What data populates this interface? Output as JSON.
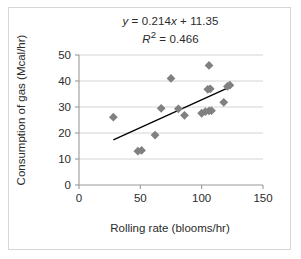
{
  "chart_data": {
    "type": "scatter",
    "title": "",
    "xlabel": "Rolling rate (blooms/hr)",
    "ylabel": "Consumption of gas (Mcal/hr)",
    "xlim": [
      0,
      150
    ],
    "ylim": [
      0,
      50
    ],
    "xticks": [
      "0",
      "50",
      "100",
      "150"
    ],
    "yticks": [
      "0",
      "10",
      "20",
      "30",
      "40",
      "50"
    ],
    "xtick_values": [
      0,
      50,
      100,
      150
    ],
    "ytick_values": [
      0,
      10,
      20,
      30,
      40,
      50
    ],
    "grid": "horizontal",
    "legend": "none",
    "marker": "diamond",
    "marker_color": "#808080",
    "trendline_color": "#000000",
    "annotations": {
      "equation": "y = 0.214x + 11.35",
      "r_squared": "R² = 0.466"
    },
    "fit": {
      "slope": 0.214,
      "intercept": 11.35,
      "r2": 0.466,
      "x_start": 28,
      "x_end": 125
    },
    "points": [
      {
        "x": 28,
        "y": 26.1
      },
      {
        "x": 48,
        "y": 13.0
      },
      {
        "x": 51,
        "y": 13.3
      },
      {
        "x": 62,
        "y": 19.2
      },
      {
        "x": 67,
        "y": 29.5
      },
      {
        "x": 75,
        "y": 41.0
      },
      {
        "x": 81,
        "y": 29.3
      },
      {
        "x": 86,
        "y": 26.8
      },
      {
        "x": 100,
        "y": 27.6
      },
      {
        "x": 103,
        "y": 28.2
      },
      {
        "x": 106,
        "y": 28.5
      },
      {
        "x": 108,
        "y": 28.6
      },
      {
        "x": 105,
        "y": 36.8
      },
      {
        "x": 107,
        "y": 37.0
      },
      {
        "x": 106,
        "y": 46.0
      },
      {
        "x": 118,
        "y": 31.8
      },
      {
        "x": 121,
        "y": 37.9
      },
      {
        "x": 123,
        "y": 38.4
      }
    ]
  }
}
